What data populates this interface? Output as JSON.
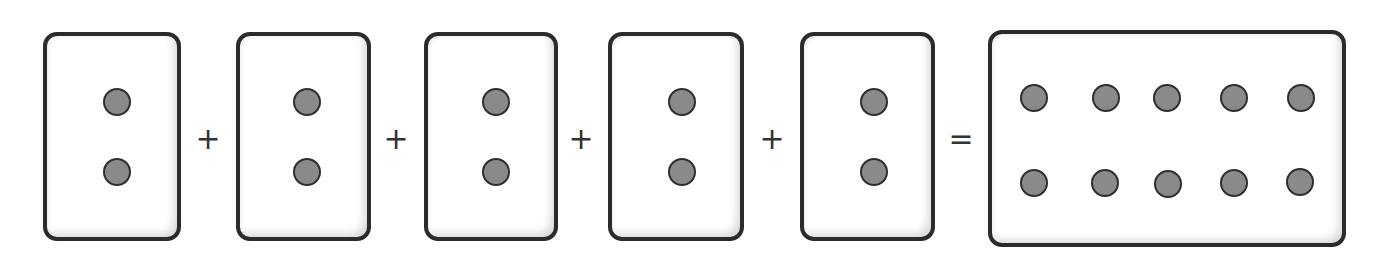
{
  "equation": {
    "text": "2 + 2 + 2 + 2 + 2 = 10",
    "addend_cards": [
      {
        "dots": 2
      },
      {
        "dots": 2
      },
      {
        "dots": 2
      },
      {
        "dots": 2
      },
      {
        "dots": 2
      }
    ],
    "operators": [
      "+",
      "+",
      "+",
      "+"
    ],
    "equals": "=",
    "result_card": {
      "dots": 10,
      "rows": 2,
      "cols": 5
    }
  },
  "colors": {
    "card_border": "#2b2b2b",
    "dot_fill": "#8a8a8a",
    "dot_outline": "#2e2e2e",
    "operator": "#333333"
  }
}
